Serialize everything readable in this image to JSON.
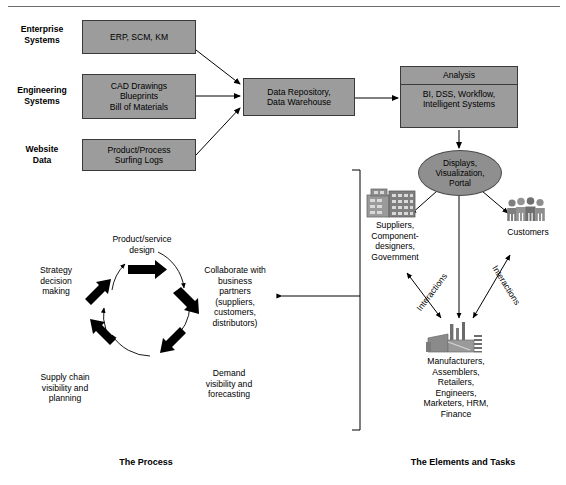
{
  "figure": {
    "top_rule": true,
    "captions": {
      "process": "The Process",
      "elements": "The Elements and Tasks"
    }
  },
  "colors": {
    "box_fill": "#9c9c9c",
    "box_stroke": "#3a3a3a",
    "ellipse_fill": "#8f8f8f",
    "arrow": "#000000",
    "icon_gray": "#8a8a8a"
  },
  "sources": {
    "rows": [
      {
        "label": "Enterprise\nSystems",
        "box": "ERP, SCM, KM"
      },
      {
        "label": "Engineering\nSystems",
        "box": "CAD Drawings\nBlueprints\nBill of Materials"
      },
      {
        "label": "Website\nData",
        "box": "Product/Process\nSurfing Logs"
      }
    ]
  },
  "pipeline": {
    "repository": "Data Repository,\nData Warehouse",
    "analysis": {
      "title": "Analysis",
      "body": "BI, DSS, Workflow,\nIntelligent Systems"
    },
    "displays": "Displays,\nVisualization,\nPortal"
  },
  "elements": {
    "suppliers": {
      "icon": "office-building-icon",
      "label": "Suppliers,\nComponent-\ndesigners,\nGovernment"
    },
    "customers": {
      "icon": "people-group-icon",
      "label": "Customers"
    },
    "manufacturers": {
      "icon": "factory-icon",
      "label": "Manufacturers,\nAssemblers,\nRetailers,\nEngineers,\nMarketers, HRM,\nFinance"
    },
    "interaction_left": "Interactions",
    "interaction_right": "Interactions"
  },
  "process": {
    "steps": [
      {
        "label": "Product/service\ndesign"
      },
      {
        "label": "Collaborate with\nbusiness\npartners\n(suppliers,\ncustomers,\ndistributors)"
      },
      {
        "label": "Demand\nvisibility and\nforecasting"
      },
      {
        "label": "Supply chain\nvisibility and\nplanning"
      },
      {
        "label": "Strategy\ndecision\nmaking"
      }
    ]
  }
}
